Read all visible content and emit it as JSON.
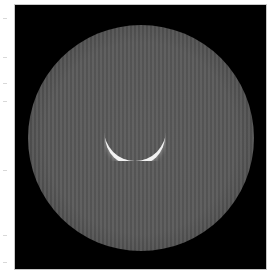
{
  "image": {
    "type": "grayscale-microscopy",
    "description": "Circular illuminated field with vertical stripe pattern and bright crescent reflection near center",
    "colors": {
      "background": "#ffffff",
      "frame": "#000000",
      "disk": "#585858",
      "crescent": "#f2f2f2"
    }
  }
}
